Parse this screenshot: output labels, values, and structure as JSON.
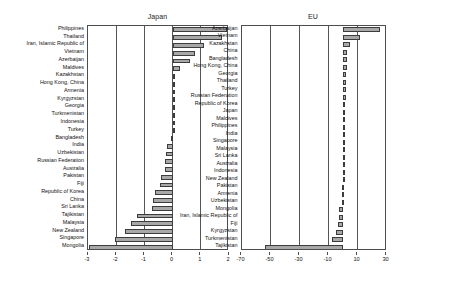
{
  "figure": {
    "background_color": "#ffffff",
    "bar_fill_color": "#a8a8a8",
    "bar_edge_color": "#3c3c3c",
    "axis_color": "#4d4d4d"
  },
  "chart_data": [
    {
      "type": "bar",
      "orientation": "horizontal",
      "title": "Japan",
      "xlabel": "",
      "ylabel": "",
      "xlim": [
        -3,
        2
      ],
      "xticks": [
        -3,
        -2,
        -1,
        0,
        1,
        2
      ],
      "xticklabels": [
        "-3",
        "-2",
        "-1",
        "0",
        "1",
        "2"
      ],
      "grid": true,
      "legend": false,
      "categories": [
        "Philippines",
        "Thailand",
        "Iran, Islamic Republic of",
        "Vietnam",
        "Azerbaijan",
        "Maldives",
        "Kazakhstan",
        "Hong Kong, China",
        "Armenia",
        "Kyrgyzstan",
        "Georgia",
        "Turkmenistan",
        "Indonesia",
        "Turkey",
        "Bangladesh",
        "India",
        "Uzbekistan",
        "Russian Federation",
        "Australia",
        "Pakistan",
        "Fiji",
        "Republic of Korea",
        "China",
        "Sri Lanka",
        "Tajikistan",
        "Malaysia",
        "New Zealand",
        "Singapore",
        "Mongolia"
      ],
      "values": [
        1.94,
        1.76,
        1.12,
        0.78,
        0.6,
        0.26,
        0.08,
        0.06,
        0.05,
        0.04,
        0.03,
        0.02,
        0.02,
        0.01,
        -0.06,
        -0.2,
        -0.22,
        -0.26,
        -0.28,
        -0.4,
        -0.45,
        -0.62,
        -0.68,
        -0.72,
        -1.28,
        -1.48,
        -1.7,
        -2.05,
        -2.95
      ]
    },
    {
      "type": "bar",
      "orientation": "horizontal",
      "title": "EU",
      "xlabel": "",
      "ylabel": "",
      "xlim": [
        -70,
        30
      ],
      "xticks": [
        -70,
        -50,
        -30,
        -10,
        10,
        30
      ],
      "xticklabels": [
        "-70",
        "-50",
        "-30",
        "-10",
        "10",
        "30"
      ],
      "grid": true,
      "legend": false,
      "categories": [
        "Azerbaijan",
        "Vietnam",
        "Kazakhstan",
        "China",
        "Bangladesh",
        "Hong Kong, China",
        "Georgia",
        "Thailand",
        "Turkey",
        "Russian Federation",
        "Republic of Korea",
        "Japan",
        "Maldives",
        "Philippines",
        "India",
        "Singapore",
        "Malaysia",
        "Sri Lanka",
        "Australia",
        "Indonesia",
        "New Zealand",
        "Pakistan",
        "Armenia",
        "Uzbekistan",
        "Mongolia",
        "Iran, Islamic Republic of",
        "Fiji",
        "Kyrgyzstan",
        "Turkmenistan",
        "Tajikistan"
      ],
      "values": [
        25.6,
        12.0,
        4.6,
        3.0,
        3.0,
        2.6,
        2.4,
        2.2,
        2.2,
        2.0,
        1.6,
        0.8,
        0.4,
        0.2,
        0.2,
        0.1,
        0.1,
        0.1,
        -0.1,
        -0.1,
        -0.3,
        -0.4,
        -0.5,
        -0.6,
        -2.6,
        -2.8,
        -3.2,
        -4.6,
        -7.8,
        -53.5
      ]
    }
  ]
}
